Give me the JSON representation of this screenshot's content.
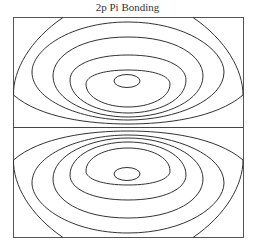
{
  "title": "2p Pi Bonding",
  "diagram": {
    "type": "contour plot",
    "lobes": [
      "upper",
      "lower"
    ],
    "node": "horizontal nodal plane at center",
    "contour_count_per_lobe": 6,
    "line_color": "#333333",
    "frame_color": "#555555"
  }
}
